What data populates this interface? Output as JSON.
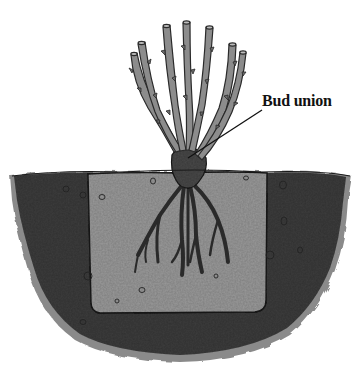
{
  "diagram": {
    "labels": [
      {
        "id": "bud-union",
        "text": "Bud union"
      }
    ],
    "parts": [
      "canes",
      "bud union",
      "roots",
      "planting hole backfill",
      "surrounding soil"
    ],
    "colors": {
      "background": "#ffffff",
      "soil_dark": "#3e3e3e",
      "soil_edge": "#8a8a8a",
      "hole_fill": "#9a9a9a",
      "hole_outline": "#1c1c1c",
      "cane": "#8c8c8c",
      "cane_outline": "#2a2a2a",
      "root": "#3a3a3a",
      "bud_union": "#4a4a4a",
      "label_text": "#111111",
      "leader_line": "#111111"
    }
  }
}
